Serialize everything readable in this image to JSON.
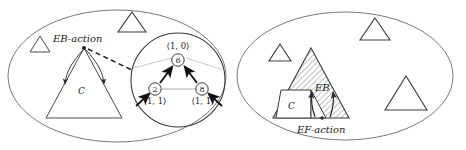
{
  "figure": {
    "title": "",
    "panels": [
      {
        "id": "left-panel",
        "name": "EB-action panel",
        "container_shape": "ellipse",
        "labels": {
          "action": "EB-action",
          "region": "C"
        },
        "small_triangles": [
          {
            "name": "triangle-top-left",
            "x": 40,
            "y": 44,
            "size": 20
          },
          {
            "name": "triangle-top-mid",
            "x": 132,
            "y": 22,
            "size": 26
          }
        ],
        "main_triangle": {
          "name": "triangle-C",
          "apex_x": 84,
          "apex_y": 48,
          "base_y": 118,
          "half_width": 38
        },
        "inset": {
          "name": "magnified-circle",
          "shape": "circle",
          "cx": 178,
          "cy": 80,
          "r": 47,
          "nodes": [
            {
              "id": "n6",
              "label": "6",
              "coord": "⟨1, 0⟩",
              "cx": 178,
              "cy": 60
            },
            {
              "id": "n2",
              "label": "2",
              "coord": "⟨1, 1⟩",
              "cx": 155,
              "cy": 89
            },
            {
              "id": "n8",
              "label": "8",
              "coord": "⟨1, 1⟩",
              "cx": 202,
              "cy": 89
            }
          ],
          "edges": [
            {
              "from": "n2",
              "to": "n6",
              "style": "bold-arrow"
            },
            {
              "from": "n8",
              "to": "n6",
              "style": "bold-arrow"
            },
            {
              "from": "n2",
              "to": "n8",
              "style": "thin-line"
            }
          ],
          "incoming_arrows": 2
        },
        "connector": {
          "name": "dashed-callout",
          "style": "dashed"
        }
      },
      {
        "id": "right-panel",
        "name": "EF-action panel",
        "container_shape": "ellipse",
        "labels": {
          "action": "EF-action",
          "region": "C",
          "eb": "EB"
        },
        "small_triangles": [
          {
            "name": "triangle-top-left",
            "x": 268,
            "y": 52,
            "size": 22
          },
          {
            "name": "triangle-top-mid",
            "x": 362,
            "y": 26,
            "size": 28
          },
          {
            "name": "triangle-right",
            "x": 405,
            "y": 105,
            "size": 40
          }
        ],
        "main_triangle": {
          "name": "triangle-hatched",
          "apex_x": 311,
          "apex_y": 48,
          "base_y": 118,
          "half_width": 38,
          "fill": "hatched"
        },
        "inner_region": {
          "name": "region-C-white",
          "fill": "#ffffff"
        },
        "arrows": 2
      }
    ],
    "colors": {
      "stroke": "#3a3a3a",
      "text": "#1a1a1a",
      "hatch": "#4a4a4a",
      "background": "#ffffff"
    }
  }
}
